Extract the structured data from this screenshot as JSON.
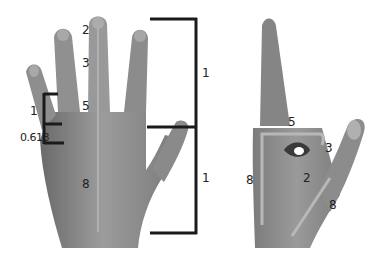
{
  "figure": {
    "left_hand": {
      "view": "back of hand, fingers spread",
      "finger_labels": [
        "2",
        "3",
        "5"
      ],
      "palm_label": "8",
      "small_bracket": {
        "upper": "1",
        "lower": "0.618"
      },
      "large_bracket": {
        "upper": "1",
        "lower": "1"
      }
    },
    "right_hand": {
      "view": "side, index finger up, thumb curled",
      "labels": {
        "top": "5",
        "joint": "3",
        "inner": "2",
        "left_edge": "8",
        "right_edge": "8"
      }
    }
  },
  "colors": {
    "bracket": "#1a1a1a",
    "skin": "#8a8a8a",
    "skin_dark": "#6e6e6e",
    "guide": "#b5b5b5",
    "text": "#222222"
  }
}
